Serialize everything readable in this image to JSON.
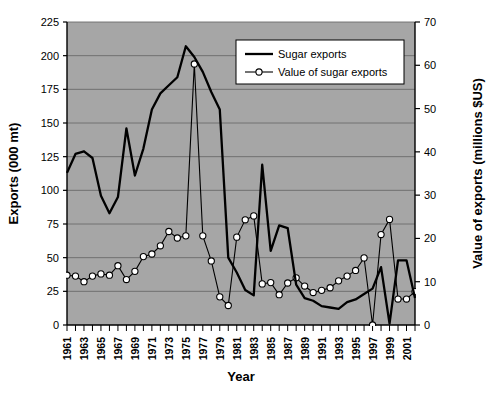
{
  "chart_data": {
    "type": "line",
    "title": "",
    "xlabel": "Year",
    "ylabel": "Exports (000 mt)",
    "y2label": "Value of exports (millions $US)",
    "grid": true,
    "legend_position": "top-right",
    "plot_background": "#a6a6a6",
    "line_color": "#000000",
    "marker_face": "#ffffff",
    "xlim": [
      1961,
      2002
    ],
    "ylim": [
      0,
      225
    ],
    "y2lim": [
      0,
      70
    ],
    "yticks": [
      0,
      25,
      50,
      75,
      100,
      125,
      150,
      175,
      200,
      225
    ],
    "y2ticks": [
      0,
      10,
      20,
      30,
      40,
      50,
      60,
      70
    ],
    "x": [
      1961,
      1962,
      1963,
      1964,
      1965,
      1966,
      1967,
      1968,
      1969,
      1970,
      1971,
      1972,
      1973,
      1974,
      1975,
      1976,
      1977,
      1978,
      1979,
      1980,
      1981,
      1982,
      1983,
      1984,
      1985,
      1986,
      1987,
      1988,
      1989,
      1990,
      1991,
      1992,
      1993,
      1994,
      1995,
      1996,
      1997,
      1998,
      1999,
      2000,
      2001,
      2002
    ],
    "xtick_labels": [
      "1961",
      "1963",
      "1965",
      "1967",
      "1969",
      "1971",
      "1973",
      "1975",
      "1977",
      "1979",
      "1981",
      "1983",
      "1985",
      "1987",
      "1989",
      "1991",
      "1993",
      "1995",
      "1997",
      "1999",
      "2001"
    ],
    "series": [
      {
        "name": "Sugar exports",
        "axis": "left",
        "units": "000 mt",
        "marker": "none",
        "values": [
          113,
          127,
          129,
          124,
          96,
          83,
          95,
          146,
          111,
          131,
          160,
          172,
          178,
          184,
          207,
          199,
          188,
          173,
          160,
          50,
          39,
          26,
          22,
          119,
          55,
          74,
          72,
          30,
          20,
          18,
          14,
          13,
          12,
          17,
          19,
          23,
          27,
          43,
          1,
          48,
          48,
          20
        ]
      },
      {
        "name": "Value of sugar exports",
        "axis": "right",
        "units": "millions $US",
        "marker": "open-circle",
        "values": [
          11.5,
          11.3,
          10.0,
          11.3,
          11.8,
          11.5,
          13.7,
          10.5,
          12.4,
          15.8,
          16.4,
          18.3,
          21.6,
          20.1,
          20.6,
          60.3,
          20.6,
          14.8,
          6.5,
          4.5,
          20.3,
          24.3,
          25.2,
          9.5,
          9.8,
          7.0,
          9.7,
          10.9,
          9.0,
          7.5,
          8.0,
          8.6,
          10.2,
          11.3,
          12.6,
          15.5,
          0.0,
          20.9,
          24.4,
          6.0,
          6.0,
          7.7
        ]
      }
    ]
  },
  "legend": {
    "entries": [
      {
        "label": "Sugar exports",
        "marker": "line"
      },
      {
        "label": "Value of sugar exports",
        "marker": "line-circle"
      }
    ]
  }
}
